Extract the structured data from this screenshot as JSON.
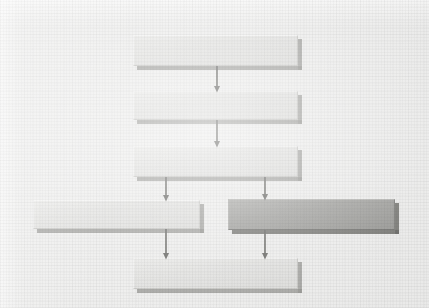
{
  "figure": {
    "kind": "flowchart",
    "medium": "scanned-paper",
    "background_color": "#ededec",
    "ink_color": "#5f5f5c",
    "box_fill_color": "#e2e2e0",
    "highlight_fill_color": "#9d9d9a",
    "shadow_color": "#8f8f8c"
  },
  "chart_data": {
    "type": "diagram",
    "title": "",
    "orientation": "top-to-bottom",
    "note": "All process boxes are blank in the source image; no legible text is present.",
    "nodes": [
      {
        "id": "n1",
        "label": "",
        "shape": "rectangle",
        "style": "plain",
        "x": 133,
        "y": 35,
        "w": 165,
        "h": 31
      },
      {
        "id": "n2",
        "label": "",
        "shape": "rectangle",
        "style": "plain",
        "x": 133,
        "y": 91,
        "w": 165,
        "h": 29
      },
      {
        "id": "n3",
        "label": "",
        "shape": "rectangle",
        "style": "plain",
        "x": 133,
        "y": 146,
        "w": 165,
        "h": 31
      },
      {
        "id": "n4",
        "label": "",
        "shape": "rectangle",
        "style": "plain",
        "x": 33,
        "y": 200,
        "w": 167,
        "h": 29
      },
      {
        "id": "n5",
        "label": "",
        "shape": "rectangle",
        "style": "highlighted",
        "x": 228,
        "y": 199,
        "w": 167,
        "h": 31
      },
      {
        "id": "n6",
        "label": "",
        "shape": "rectangle",
        "style": "plain",
        "x": 133,
        "y": 258,
        "w": 165,
        "h": 31
      }
    ],
    "edges": [
      {
        "from": "n1",
        "to": "n2",
        "label": "",
        "arrow": "single",
        "x1": 217,
        "y1": 66,
        "x2": 217,
        "y2": 89
      },
      {
        "from": "n2",
        "to": "n3",
        "label": "",
        "arrow": "single",
        "x1": 217,
        "y1": 120,
        "x2": 217,
        "y2": 144
      },
      {
        "from": "n3",
        "to": "n4",
        "label": "",
        "arrow": "single",
        "x1": 166,
        "y1": 177,
        "x2": 166,
        "y2": 198
      },
      {
        "from": "n3",
        "to": "n5",
        "label": "",
        "arrow": "single",
        "x1": 265,
        "y1": 177,
        "x2": 265,
        "y2": 197
      },
      {
        "from": "n4",
        "to": "n6",
        "label": "",
        "arrow": "single",
        "x1": 166,
        "y1": 229,
        "x2": 166,
        "y2": 256
      },
      {
        "from": "n5",
        "to": "n6",
        "label": "",
        "arrow": "single",
        "x1": 265,
        "y1": 230,
        "x2": 265,
        "y2": 256
      }
    ]
  }
}
